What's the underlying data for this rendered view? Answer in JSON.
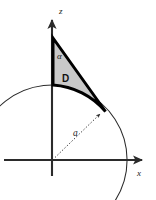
{
  "figure": {
    "type": "geometry-diagram",
    "background_color": "#ffffff",
    "canvas": {
      "width": 156,
      "height": 200
    },
    "axes": {
      "origin": {
        "x": 52,
        "y": 160
      },
      "color": "#2b2b2b",
      "vertical": {
        "name": "z",
        "label": "z",
        "label_position": {
          "x": 59,
          "y": 13
        },
        "top": {
          "x": 52,
          "y": 16
        },
        "bottom": {
          "x": 52,
          "y": 176
        },
        "arrow": "up"
      },
      "horizontal": {
        "name": "x",
        "label": "x",
        "label_position": {
          "x": 138,
          "y": 174
        },
        "left": {
          "x": 4,
          "y": 160
        },
        "right": {
          "x": 146,
          "y": 160
        },
        "arrow": "right"
      }
    },
    "arc": {
      "name": "circle-of-radius-a",
      "center": {
        "x": 52,
        "y": 160
      },
      "radius": 75,
      "color": "#2b2b2b",
      "stroke_width": 1,
      "start_angle_deg": 160,
      "end_angle_deg": -33
    },
    "region": {
      "name": "D",
      "label": "D",
      "label_position": {
        "x": 63,
        "y": 79
      },
      "fill_color": "#c9c9c9",
      "stroke_color": "#000000",
      "stroke_width": 3,
      "apex": {
        "x": 53,
        "y": 38
      },
      "arc_point": {
        "x": 105,
        "y": 111
      },
      "axis_foot": {
        "x": 53,
        "y": 85
      }
    },
    "angle": {
      "name": "alpha",
      "label": "α",
      "label_position": {
        "x": 58,
        "y": 57
      }
    },
    "radius_arrow": {
      "name": "radius-a",
      "label": "a",
      "label_position": {
        "x": 76,
        "y": 133
      },
      "from": {
        "x": 54,
        "y": 158
      },
      "to": {
        "x": 101,
        "y": 113
      },
      "style": "dotted",
      "color": "#3a3a3a"
    }
  }
}
